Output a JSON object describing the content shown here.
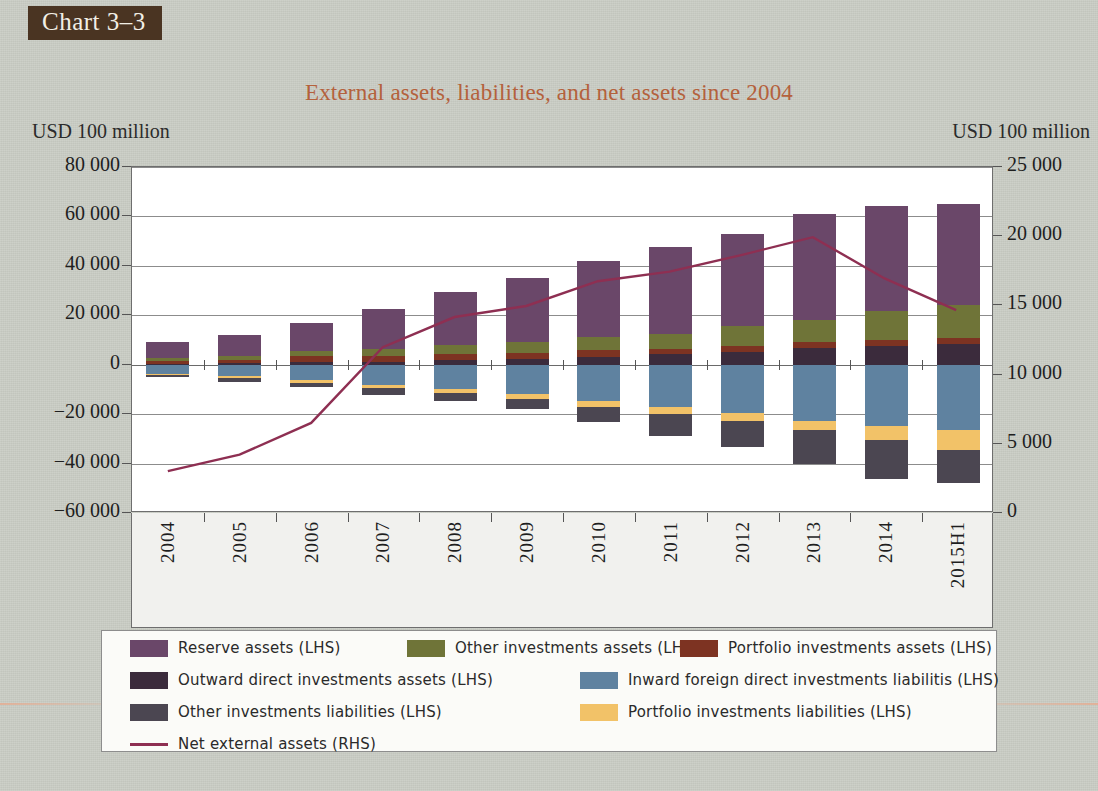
{
  "figure": {
    "tag": "Chart 3–3",
    "title": "External assets, liabilities, and net assets since 2004",
    "unit_left": "USD 100 million",
    "unit_right": "USD 100 million"
  },
  "legend": {
    "items": [
      {
        "label": "Reserve assets (LHS)",
        "color": "#6a4769",
        "type": "swatch"
      },
      {
        "label": "Other investments assets (LHS)",
        "color": "#6f7438",
        "type": "swatch"
      },
      {
        "label": "Portfolio investments assets (LHS)",
        "color": "#7d3322",
        "type": "swatch"
      },
      {
        "label": "Outward direct investments assets (LHS)",
        "color": "#3b2b3c",
        "type": "swatch"
      },
      {
        "label": "Inward foreign direct investments liabilitis (LHS)",
        "color": "#5f82a0",
        "type": "swatch"
      },
      {
        "label": "Other investments liabilities (LHS)",
        "color": "#4b4651",
        "type": "swatch"
      },
      {
        "label": "Portfolio investments liabilities (LHS)",
        "color": "#f2c268",
        "type": "swatch"
      },
      {
        "label": "Net external assets (RHS)",
        "color": "#8e2f52",
        "type": "line"
      }
    ]
  },
  "chart_data": {
    "type": "bar",
    "subtype": "stacked-bar-with-line",
    "title": "External assets, liabilities, and net assets since 2004",
    "xlabel": "",
    "ylabel": "USD 100 million",
    "ylabel_right": "USD 100 million",
    "ylim": [
      -60000,
      80000
    ],
    "ylim_right": [
      0,
      25000
    ],
    "yticks": [
      "80 000",
      "60 000",
      "40 000",
      "20 000",
      "0",
      "−20 000",
      "−40 000",
      "−60 000"
    ],
    "ytick_values": [
      80000,
      60000,
      40000,
      20000,
      0,
      -20000,
      -40000,
      -60000
    ],
    "yticks_right": [
      "25 000",
      "20 000",
      "15 000",
      "10 000",
      "5 000",
      "0"
    ],
    "ytick_values_right": [
      25000,
      20000,
      15000,
      10000,
      5000,
      0
    ],
    "grid": true,
    "legend_position": "bottom",
    "categories": [
      "2004",
      "2005",
      "2006",
      "2007",
      "2008",
      "2009",
      "2010",
      "2011",
      "2012",
      "2013",
      "2014",
      "2015H1"
    ],
    "series": [
      {
        "name": "Outward direct investments assets (LHS)",
        "color": "#3b2b3c",
        "axis": "left",
        "stack": "positive",
        "values": [
          450,
          600,
          900,
          1100,
          1800,
          2300,
          3200,
          4200,
          5300,
          6600,
          7400,
          8200
        ]
      },
      {
        "name": "Portfolio investments assets (LHS)",
        "color": "#7d3322",
        "axis": "left",
        "stack": "positive",
        "values": [
          920,
          1170,
          2650,
          2280,
          2530,
          2430,
          2570,
          2040,
          2400,
          2580,
          2630,
          2610
        ]
      },
      {
        "name": "Other investments assets (LHS)",
        "color": "#6f7438",
        "axis": "left",
        "stack": "positive",
        "values": [
          1450,
          1600,
          2100,
          3100,
          3600,
          4400,
          5600,
          6300,
          7800,
          9000,
          11800,
          13400
        ]
      },
      {
        "name": "Reserve assets (LHS)",
        "color": "#6a4769",
        "axis": "left",
        "stack": "positive",
        "values": [
          6300,
          8600,
          11100,
          16200,
          21500,
          26000,
          30500,
          35100,
          37300,
          43000,
          42300,
          41000
        ]
      },
      {
        "name": "Inward foreign direct investments liabilitis (LHS)",
        "color": "#5f82a0",
        "axis": "left",
        "stack": "negative",
        "values": [
          -3600,
          -4700,
          -6300,
          -8300,
          -9800,
          -12000,
          -14600,
          -17000,
          -19500,
          -22700,
          -24900,
          -26500
        ]
      },
      {
        "name": "Portfolio investments liabilities (LHS)",
        "color": "#f2c268",
        "axis": "left",
        "stack": "negative",
        "values": [
          -600,
          -700,
          -900,
          -1300,
          -1500,
          -1900,
          -2400,
          -2800,
          -3300,
          -3900,
          -5700,
          -8200
        ]
      },
      {
        "name": "Other investments liabilities (LHS)",
        "color": "#4b4651",
        "axis": "left",
        "stack": "negative",
        "values": [
          -900,
          -1400,
          -1800,
          -2500,
          -3300,
          -3900,
          -6100,
          -8900,
          -10400,
          -13400,
          -15700,
          -13300
        ]
      }
    ],
    "line_series": {
      "name": "Net external assets (RHS)",
      "color": "#8e2f52",
      "axis": "right",
      "values": [
        2900,
        4100,
        6400,
        11900,
        14100,
        14900,
        16700,
        17400,
        18600,
        19900,
        16900,
        14600
      ]
    },
    "bar_totals_positive": [
      9120,
      11970,
      16750,
      22680,
      29430,
      35130,
      41870,
      47640,
      52800,
      61180,
      64130,
      65210
    ],
    "bar_totals_negative": [
      -5100,
      -6800,
      -9000,
      -12100,
      -14600,
      -17800,
      -23100,
      -28700,
      -33200,
      -40000,
      -46300,
      -48000
    ]
  }
}
